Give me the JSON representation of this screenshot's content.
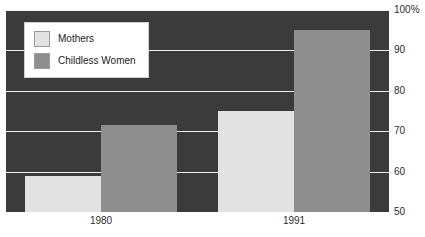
{
  "chart_data": {
    "type": "bar",
    "title": "",
    "xlabel": "",
    "ylabel": "",
    "categories": [
      "1980",
      "1991"
    ],
    "series": [
      {
        "name": "Mothers",
        "values": [
          59,
          75
        ],
        "color": "#e2e2e2"
      },
      {
        "name": "Childless Women",
        "values": [
          71.5,
          95
        ],
        "color": "#8e8e8e"
      }
    ],
    "ylim": [
      50,
      100
    ],
    "y_ticks": [
      {
        "value": 100,
        "label": "100%"
      },
      {
        "value": 90,
        "label": "90"
      },
      {
        "value": 80,
        "label": "80"
      },
      {
        "value": 70,
        "label": "70"
      },
      {
        "value": 60,
        "label": "60"
      },
      {
        "value": 50,
        "label": "50"
      }
    ],
    "grid": true,
    "y_axis_position": "right",
    "legend_position": "top-left",
    "plot_background": "#3b3b3b",
    "gridline_color": "#efefef"
  },
  "legend": {
    "items": [
      {
        "label": "Mothers"
      },
      {
        "label": "Childless Women"
      }
    ]
  },
  "y_axis": {
    "labels": [
      "100%",
      "90",
      "80",
      "70",
      "60",
      "50"
    ]
  },
  "x_axis": {
    "labels": [
      "1980",
      "1991"
    ]
  }
}
